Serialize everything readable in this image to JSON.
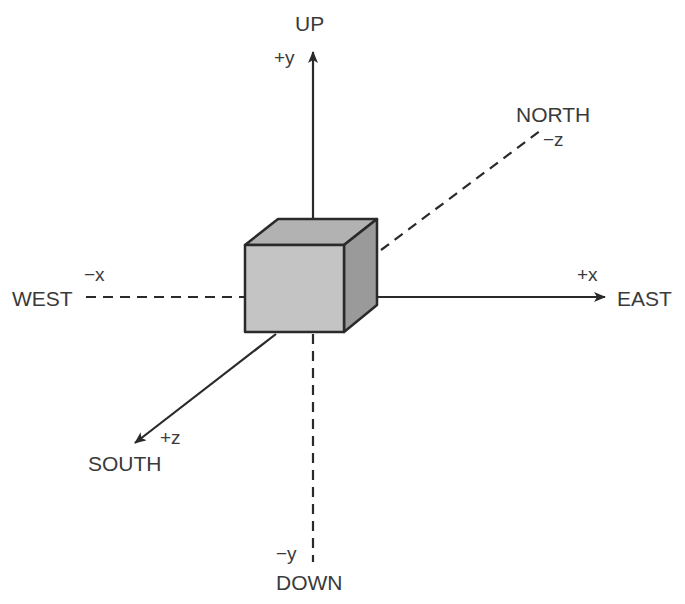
{
  "diagram": {
    "colors": {
      "line": "#2a2a2a",
      "cube_front": "#c4c4c4",
      "cube_top": "#b2b2b2",
      "cube_side": "#9a9a9a",
      "text": "#3a3a3a"
    },
    "directions": {
      "up": "UP",
      "down": "DOWN",
      "east": "EAST",
      "west": "WEST",
      "north": "NORTH",
      "south": "SOUTH"
    },
    "axes": {
      "pos_y": "+y",
      "neg_y": "−y",
      "pos_x": "+x",
      "neg_x": "−x",
      "pos_z": "+z",
      "neg_z": "−z"
    }
  }
}
